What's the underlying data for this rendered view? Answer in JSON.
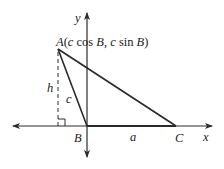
{
  "diagram": {
    "axes": {
      "x_label": "x",
      "y_label": "y"
    },
    "points": {
      "A": {
        "name": "A",
        "coords_label": "(c cos B, c sin B)",
        "prefix_label": "A",
        "coord_open": "(",
        "c1": "c",
        "cos": " cos ",
        "B1": "B",
        "comma": ", ",
        "c2": "c",
        "sin": " sin ",
        "B2": "B",
        "coord_close": ")"
      },
      "B": {
        "name": "B"
      },
      "C": {
        "name": "C"
      }
    },
    "segments": {
      "h": "h",
      "c": "c",
      "a": "a"
    },
    "colors": {
      "stroke": "#2a2a2a",
      "text": "#222222"
    }
  }
}
